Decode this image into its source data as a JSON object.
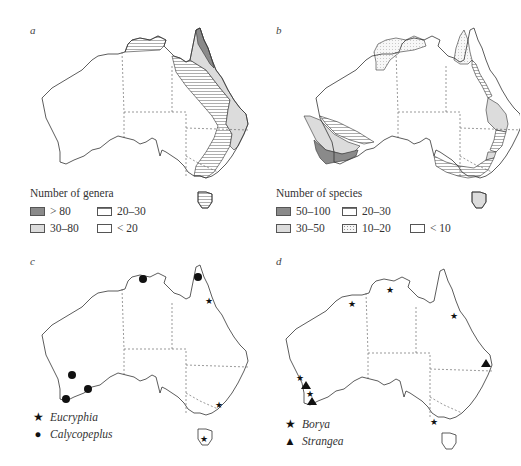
{
  "figure": {
    "panels": [
      {
        "letter": "a",
        "legend": {
          "title": "Number of genera",
          "items": [
            {
              "label": "> 80",
              "fill": "dark",
              "color": "#8a8a8a"
            },
            {
              "label": "20–30",
              "fill": "horizontal-hatch",
              "color": "#777777"
            },
            {
              "label": "30–80",
              "fill": "light",
              "color": "#dcdcdc"
            },
            {
              "label": "< 20",
              "fill": "empty",
              "color": "#ffffff"
            }
          ]
        }
      },
      {
        "letter": "b",
        "legend": {
          "title": "Number of species",
          "items": [
            {
              "label": "50–100",
              "fill": "dark",
              "color": "#8a8a8a"
            },
            {
              "label": "20–30",
              "fill": "horizontal-hatch",
              "color": "#777777"
            },
            {
              "label": "30–50",
              "fill": "light",
              "color": "#dcdcdc"
            },
            {
              "label": "10–20",
              "fill": "dotted",
              "color": "#f0f0f0"
            },
            {
              "label": "< 10",
              "fill": "empty",
              "color": "#ffffff"
            }
          ]
        }
      },
      {
        "letter": "c",
        "legend": {
          "items": [
            {
              "symbol": "star",
              "glyph": "★",
              "label": "Eucryphia"
            },
            {
              "symbol": "circle",
              "glyph": "●",
              "label": "Calycopeplus"
            }
          ]
        },
        "markers": {
          "Eucryphia": [
            "NE Queensland coast",
            "SE New South Wales coast",
            "Tasmania"
          ],
          "Calycopeplus": [
            "Northern Territory (Top End)",
            "Cape York",
            "SW Western Australia inland",
            "SW Western Australia south coast (Albany)",
            "SW Western Australia south coast (east)"
          ]
        }
      },
      {
        "letter": "d",
        "legend": {
          "items": [
            {
              "symbol": "star",
              "glyph": "★",
              "label": "Borya"
            },
            {
              "symbol": "triangle",
              "glyph": "▲",
              "label": "Strangea"
            }
          ]
        },
        "markers": {
          "Borya": [
            "Kimberley",
            "Top End (Arnhem Land)",
            "NE Queensland",
            "SW WA (north)",
            "SW WA (central)",
            "Western Victoria"
          ],
          "Strangea": [
            "SW WA (Perth region)",
            "SW WA (south coast)",
            "SE Queensland coast"
          ]
        }
      }
    ]
  }
}
